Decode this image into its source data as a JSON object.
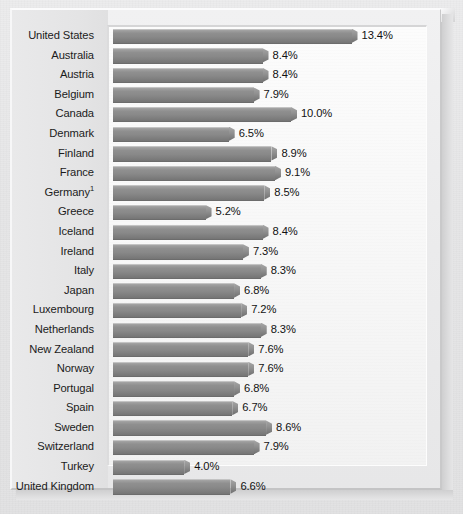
{
  "chart_data": {
    "type": "bar",
    "orientation": "horizontal",
    "title": "",
    "subtitle": "",
    "xlabel": "",
    "ylabel": "",
    "grid": false,
    "legend": null,
    "value_suffix": "%",
    "xlim": [
      0,
      14
    ],
    "categories": [
      "United States",
      "Australia",
      "Austria",
      "Belgium",
      "Canada",
      "Denmark",
      "Finland",
      "France",
      "Germany¹",
      "Greece",
      "Iceland",
      "Ireland",
      "Italy",
      "Japan",
      "Luxembourg",
      "Netherlands",
      "New Zealand",
      "Norway",
      "Portugal",
      "Spain",
      "Sweden",
      "Switzerland",
      "Turkey",
      "United Kingdom"
    ],
    "values": [
      13.4,
      8.4,
      8.4,
      7.9,
      10.0,
      6.5,
      8.9,
      9.1,
      8.5,
      5.2,
      8.4,
      7.3,
      8.3,
      6.8,
      7.2,
      8.3,
      7.6,
      7.6,
      6.8,
      6.7,
      8.6,
      7.9,
      4.0,
      6.6
    ],
    "value_labels": [
      "13.4%",
      "8.4%",
      "8.4%",
      "7.9%",
      "10.0%",
      "6.5%",
      "8.9%",
      "9.1%",
      "8.5%",
      "5.2%",
      "8.4%",
      "7.3%",
      "8.3%",
      "6.8%",
      "7.2%",
      "8.3%",
      "7.6%",
      "7.6%",
      "6.8%",
      "6.7%",
      "8.6%",
      "7.9%",
      "4.0%",
      "6.6%"
    ],
    "colors": {
      "bar_top": "#aeaeae",
      "bar_mid": "#898989",
      "bar_bottom": "#757575",
      "plot_background": "#fbfbfb",
      "page_background": "#e8e8e8",
      "label_text": "#1b1b1b",
      "value_text": "#121212"
    }
  },
  "rows": [
    {
      "label": "United States",
      "label_main": "United States",
      "superscript": "",
      "value": 13.4,
      "value_label": "13.4%"
    },
    {
      "label": "Australia",
      "label_main": "Australia",
      "superscript": "",
      "value": 8.4,
      "value_label": "8.4%"
    },
    {
      "label": "Austria",
      "label_main": "Austria",
      "superscript": "",
      "value": 8.4,
      "value_label": "8.4%"
    },
    {
      "label": "Belgium",
      "label_main": "Belgium",
      "superscript": "",
      "value": 7.9,
      "value_label": "7.9%"
    },
    {
      "label": "Canada",
      "label_main": "Canada",
      "superscript": "",
      "value": 10.0,
      "value_label": "10.0%"
    },
    {
      "label": "Denmark",
      "label_main": "Denmark",
      "superscript": "",
      "value": 6.5,
      "value_label": "6.5%"
    },
    {
      "label": "Finland",
      "label_main": "Finland",
      "superscript": "",
      "value": 8.9,
      "value_label": "8.9%"
    },
    {
      "label": "France",
      "label_main": "France",
      "superscript": "",
      "value": 9.1,
      "value_label": "9.1%"
    },
    {
      "label": "Germany¹",
      "label_main": "Germany",
      "superscript": "1",
      "value": 8.5,
      "value_label": "8.5%"
    },
    {
      "label": "Greece",
      "label_main": "Greece",
      "superscript": "",
      "value": 5.2,
      "value_label": "5.2%"
    },
    {
      "label": "Iceland",
      "label_main": "Iceland",
      "superscript": "",
      "value": 8.4,
      "value_label": "8.4%"
    },
    {
      "label": "Ireland",
      "label_main": "Ireland",
      "superscript": "",
      "value": 7.3,
      "value_label": "7.3%"
    },
    {
      "label": "Italy",
      "label_main": "Italy",
      "superscript": "",
      "value": 8.3,
      "value_label": "8.3%"
    },
    {
      "label": "Japan",
      "label_main": "Japan",
      "superscript": "",
      "value": 6.8,
      "value_label": "6.8%"
    },
    {
      "label": "Luxembourg",
      "label_main": "Luxembourg",
      "superscript": "",
      "value": 7.2,
      "value_label": "7.2%"
    },
    {
      "label": "Netherlands",
      "label_main": "Netherlands",
      "superscript": "",
      "value": 8.3,
      "value_label": "8.3%"
    },
    {
      "label": "New Zealand",
      "label_main": "New Zealand",
      "superscript": "",
      "value": 7.6,
      "value_label": "7.6%"
    },
    {
      "label": "Norway",
      "label_main": "Norway",
      "superscript": "",
      "value": 7.6,
      "value_label": "7.6%"
    },
    {
      "label": "Portugal",
      "label_main": "Portugal",
      "superscript": "",
      "value": 6.8,
      "value_label": "6.8%"
    },
    {
      "label": "Spain",
      "label_main": "Spain",
      "superscript": "",
      "value": 6.7,
      "value_label": "6.7%"
    },
    {
      "label": "Sweden",
      "label_main": "Sweden",
      "superscript": "",
      "value": 8.6,
      "value_label": "8.6%"
    },
    {
      "label": "Switzerland",
      "label_main": "Switzerland",
      "superscript": "",
      "value": 7.9,
      "value_label": "7.9%"
    },
    {
      "label": "Turkey",
      "label_main": "Turkey",
      "superscript": "",
      "value": 4.0,
      "value_label": "4.0%"
    },
    {
      "label": "United Kingdom",
      "label_main": "United Kingdom",
      "superscript": "",
      "value": 6.6,
      "value_label": "6.6%"
    }
  ],
  "scale": {
    "px_per_unit": 17.8,
    "bar_origin_x": 113
  }
}
